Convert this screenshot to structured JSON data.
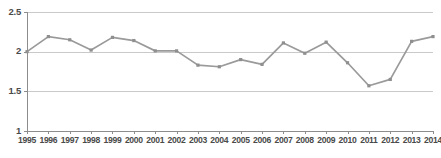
{
  "chart_data": {
    "type": "line",
    "title": "",
    "subtitle": "",
    "xlabel": "",
    "ylabel": "",
    "categories": [
      "1995",
      "1996",
      "1997",
      "1998",
      "1999",
      "2000",
      "2001",
      "2002",
      "2003",
      "2004",
      "2005",
      "2006",
      "2007",
      "2008",
      "2009",
      "2010",
      "2011",
      "2012",
      "2013",
      "2014"
    ],
    "x": [
      1995,
      1996,
      1997,
      1998,
      1999,
      2000,
      2001,
      2002,
      2003,
      2004,
      2005,
      2006,
      2007,
      2008,
      2009,
      2010,
      2011,
      2012,
      2013,
      2014
    ],
    "values": [
      2.0,
      2.19,
      2.15,
      2.02,
      2.18,
      2.14,
      2.01,
      2.01,
      1.83,
      1.81,
      1.9,
      1.84,
      2.11,
      1.98,
      2.12,
      1.86,
      1.57,
      1.65,
      2.13,
      2.19
    ],
    "series": [
      {
        "name": "series-1",
        "color": "#9a9a9a",
        "values": [
          2.0,
          2.19,
          2.15,
          2.02,
          2.18,
          2.14,
          2.01,
          2.01,
          1.83,
          1.81,
          1.9,
          1.84,
          2.11,
          1.98,
          2.12,
          1.86,
          1.57,
          1.65,
          2.13,
          2.19
        ]
      }
    ],
    "ylim": [
      1,
      2.5
    ],
    "yticks": [
      1,
      1.5,
      2,
      2.5
    ],
    "ytick_labels": [
      "1",
      "1.5",
      "2",
      "2.5"
    ],
    "xlim": [
      1995,
      2014
    ],
    "grid": true,
    "grid_axis": "y",
    "legend": false,
    "legend_position": "none",
    "markers": true,
    "annotations": []
  },
  "style": {
    "line_color": "#9a9a9a",
    "marker_color": "#8f8f8f",
    "grid_color": "#c9c9c9",
    "axis_color": "#8d8d8d",
    "label_color": "#4a4a4a",
    "background": "#ffffff"
  },
  "geometry": {
    "width": 441,
    "height": 158,
    "plot_left": 27,
    "plot_right": 433,
    "plot_top": 12,
    "plot_bottom": 131
  }
}
